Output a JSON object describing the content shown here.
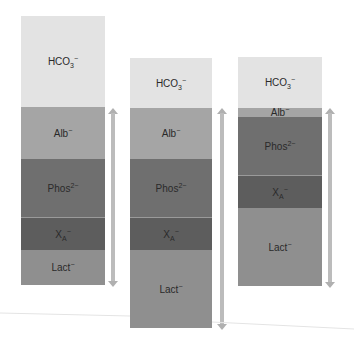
{
  "colors": {
    "hco3": "#e3e3e3",
    "alb": "#a5a5a5",
    "phos": "#6f6f6f",
    "xa": "#5d5d5d",
    "lact": "#8f8f8f",
    "arrow": "#bcbcbc"
  },
  "columns": [
    {
      "segments": [
        {
          "key": "hco3",
          "base": "HCO",
          "sub": "3",
          "sup": "−"
        },
        {
          "key": "alb",
          "base": "Alb",
          "sub": "",
          "sup": "−"
        },
        {
          "key": "phos",
          "base": "Phos",
          "sub": "",
          "sup": "2−"
        },
        {
          "key": "xa",
          "base": "X",
          "sub": "A",
          "sup": "−"
        },
        {
          "key": "lact",
          "base": "Lact",
          "sub": "",
          "sup": "−"
        }
      ]
    },
    {
      "segments": [
        {
          "key": "hco3",
          "base": "HCO",
          "sub": "3",
          "sup": "−"
        },
        {
          "key": "alb",
          "base": "Alb",
          "sub": "",
          "sup": "−"
        },
        {
          "key": "phos",
          "base": "Phos",
          "sub": "",
          "sup": "2−"
        },
        {
          "key": "xa",
          "base": "X",
          "sub": "A",
          "sup": "−"
        },
        {
          "key": "lact",
          "base": "Lact",
          "sub": "",
          "sup": "−"
        }
      ]
    },
    {
      "segments": [
        {
          "key": "hco3",
          "base": "HCO",
          "sub": "3",
          "sup": "−"
        },
        {
          "key": "alb",
          "base": "Alb",
          "sub": "",
          "sup": "−"
        },
        {
          "key": "phos",
          "base": "Phos",
          "sub": "",
          "sup": "2−"
        },
        {
          "key": "xa",
          "base": "X",
          "sub": "A",
          "sup": "−"
        },
        {
          "key": "lact",
          "base": "Lact",
          "sub": "",
          "sup": "−"
        }
      ]
    }
  ]
}
